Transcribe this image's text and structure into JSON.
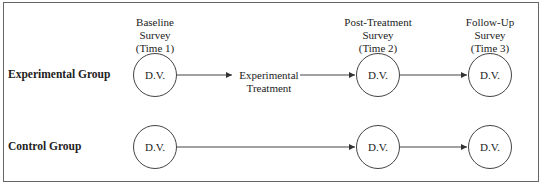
{
  "diagram": {
    "columns": [
      {
        "id": "baseline",
        "lines": [
          "Baseline",
          "Survey",
          "(Time 1)"
        ]
      },
      {
        "id": "post",
        "lines": [
          "Post-Treatment",
          "Survey",
          "(Time 2)"
        ]
      },
      {
        "id": "followup",
        "lines": [
          "Follow-Up",
          "Survey",
          "(Time 3)"
        ]
      }
    ],
    "groups": [
      {
        "label": "Experimental Group",
        "nodes": [
          "D.V.",
          "D.V.",
          "D.V."
        ],
        "treatment": [
          "Experimental",
          "Treatment"
        ]
      },
      {
        "label": "Control Group",
        "nodes": [
          "D.V.",
          "D.V.",
          "D.V."
        ]
      }
    ],
    "colors": {
      "line": "#444444",
      "frame": "#666666",
      "text": "#222222"
    }
  }
}
